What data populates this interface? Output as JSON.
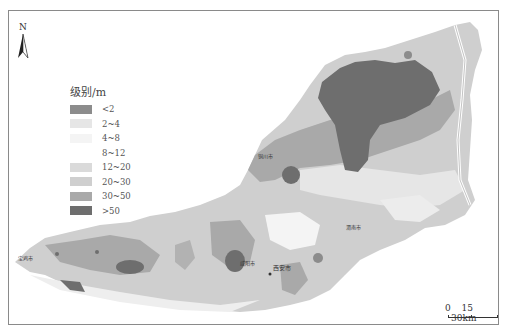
{
  "map": {
    "north_arrow_label": "N",
    "legend": {
      "title": "级别/m",
      "items": [
        {
          "label": "<2",
          "color": "#8c8c8c"
        },
        {
          "label": "2~4",
          "color": "#e6e6e6"
        },
        {
          "label": "4~8",
          "color": "#f4f4f4"
        },
        {
          "label": "8~12",
          "color": "#ffffff"
        },
        {
          "label": "12~20",
          "color": "#dadada"
        },
        {
          "label": "20~30",
          "color": "#cfcfcf"
        },
        {
          "label": "30~50",
          "color": "#a9a9a9"
        },
        {
          "label": ">50",
          "color": "#6e6e6e"
        }
      ]
    },
    "scale_bar": {
      "ticks": [
        "0",
        "15",
        "30km"
      ]
    },
    "cities": [
      {
        "name": "宝鸡市",
        "x": 18,
        "y": 254
      },
      {
        "name": "咸阳市",
        "x": 240,
        "y": 259
      },
      {
        "name": "西安市",
        "x": 273,
        "y": 263
      },
      {
        "name": "铜川市",
        "x": 258,
        "y": 152
      },
      {
        "name": "渭南市",
        "x": 346,
        "y": 223
      }
    ]
  }
}
